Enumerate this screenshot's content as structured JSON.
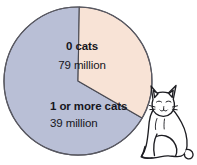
{
  "figure": {
    "background_color": "#ffffff",
    "text_color": "#16161c"
  },
  "chart_data": {
    "type": "pie",
    "title": "",
    "xlabel": "",
    "ylabel": "",
    "unit": "million households",
    "total": 118,
    "categories": [
      "0 cats",
      "1 or more cats"
    ],
    "values": [
      79,
      39
    ],
    "value_labels": [
      "79 million",
      "39 million"
    ],
    "percentages": [
      66.9,
      33.1
    ],
    "colors": [
      "#b9bfd6",
      "#f8e3d6"
    ],
    "stroke_color": "#4a4a52",
    "legend": "none",
    "grid": false,
    "start_angle_deg": 120,
    "slices": [
      {
        "name": "0 cats",
        "value": 79,
        "value_label": "79 million",
        "percent": 66.9,
        "sweep_deg": 241,
        "color": "#b9bfd6"
      },
      {
        "name": "1 or more cats",
        "value": 39,
        "value_label": "39 million",
        "percent": 33.1,
        "sweep_deg": 119,
        "color": "#f8e3d6"
      }
    ]
  },
  "labels": {
    "zero_cats": {
      "name": "0 cats",
      "value": "79 million"
    },
    "one_or_more_cats": {
      "name": "1 or more cats",
      "value": "39 million"
    }
  },
  "decoration": {
    "cat_illustration": {
      "name": "sitting-cat",
      "fill": "#ffffff",
      "outline": "#1d1d22"
    }
  }
}
